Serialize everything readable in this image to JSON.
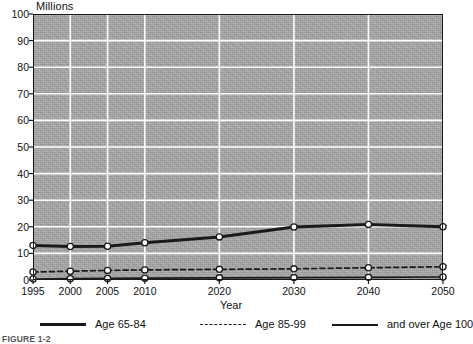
{
  "chart_data": {
    "type": "line",
    "title": "",
    "subtitle": "",
    "xlabel": "Year",
    "ylabel": "Millions",
    "x": [
      1995,
      2000,
      2005,
      2010,
      2020,
      2030,
      2040,
      2050
    ],
    "xtick_labels": [
      "1995",
      "2000",
      "2005",
      "2010",
      "2020",
      "2030",
      "2040",
      "2050"
    ],
    "ytick_labels": [
      "0",
      "10",
      "20",
      "30",
      "40",
      "50",
      "60",
      "70",
      "80",
      "90",
      "100"
    ],
    "yticks": [
      0,
      10,
      20,
      30,
      40,
      50,
      60,
      70,
      80,
      90,
      100
    ],
    "ylim": [
      0,
      100
    ],
    "xlim": [
      1995,
      2050
    ],
    "grid": "horizontal-and-vertical-white",
    "legend_position": "below-axes",
    "markers": "open-circle",
    "plot_background": "#a9a9a9",
    "gridline_color": "#ffffff",
    "line_color": "#1a1a1a",
    "series": [
      {
        "name": "Age 65-84",
        "style": "solid-thick",
        "values": [
          13.0,
          12.6,
          12.7,
          14.0,
          16.2,
          19.9,
          20.9,
          20.0
        ]
      },
      {
        "name": "Age 85-99",
        "style": "dashed",
        "values": [
          3.0,
          3.3,
          3.6,
          3.8,
          4.0,
          4.2,
          4.6,
          5.0
        ]
      },
      {
        "name": "and over Age 100",
        "style": "solid-thin",
        "values": [
          0.4,
          0.5,
          0.6,
          0.7,
          0.8,
          0.9,
          1.0,
          1.1
        ]
      }
    ]
  },
  "legend": {
    "items": [
      {
        "label": "Age 65-84",
        "style": "solid-thick"
      },
      {
        "label": "Age 85-99",
        "style": "dashed"
      },
      {
        "label": "and over Age 100",
        "style": "solid-thin"
      }
    ]
  },
  "axis": {
    "y_unit_label": "Millions",
    "x_title": "Year"
  },
  "caption": {
    "text": "FIGURE 1-2"
  }
}
